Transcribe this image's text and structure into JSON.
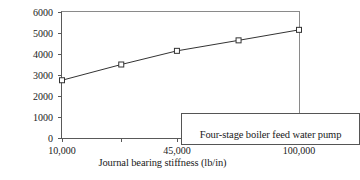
{
  "chart_data": {
    "type": "line",
    "title": "",
    "xlabel": "Journal bearing stiffness (lb/in)",
    "ylabel": "Critical speed (rpm)",
    "x": [
      10000,
      22500,
      45000,
      70000,
      100000
    ],
    "values": [
      2750,
      3500,
      4150,
      4650,
      5150
    ],
    "series": [
      {
        "name": "Four-stage boiler feed water pump",
        "values": [
          2750,
          3500,
          4150,
          4650,
          5150
        ]
      }
    ],
    "xtick_labels": [
      "10,000",
      "",
      "45,000",
      "",
      "100,000"
    ],
    "xtick_positions": [
      0,
      25,
      48.5,
      74.5,
      100
    ],
    "ytick_labels": [
      "0",
      "1000",
      "2000",
      "3000",
      "4000",
      "5000",
      "6000"
    ],
    "ytick_values": [
      0,
      1000,
      2000,
      3000,
      4000,
      5000,
      6000
    ],
    "ylim": [
      0,
      6000
    ],
    "grid": false,
    "legend_position": "none",
    "marker": "open-square",
    "line_color": "#333333",
    "marker_color": "#333333",
    "axis_color": "#595959",
    "background": "#ffffff",
    "annotations": [
      {
        "text": "Four-stage boiler feed water pump",
        "boxed": true
      }
    ]
  },
  "annotation": {
    "label": "Four-stage boiler feed water pump"
  }
}
